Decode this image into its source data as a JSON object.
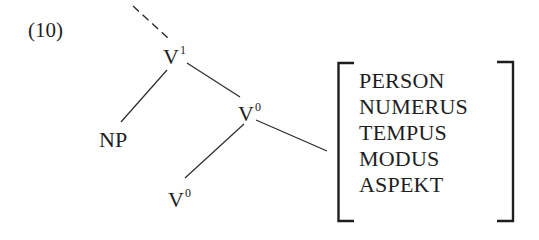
{
  "example": {
    "number": "(10)"
  },
  "tree": {
    "nodes": {
      "v1": {
        "base": "V",
        "sup": "1"
      },
      "np": {
        "label": "NP"
      },
      "v0_upper": {
        "base": "V",
        "sup": "0"
      },
      "v0_lower": {
        "base": "V",
        "sup": "0"
      }
    },
    "edges": [
      {
        "from": "above",
        "to": "v1",
        "style": "dashed"
      },
      {
        "from": "v1",
        "to": "np",
        "style": "solid"
      },
      {
        "from": "v1",
        "to": "v0_upper",
        "style": "solid"
      },
      {
        "from": "v0_upper",
        "to": "v0_lower",
        "style": "solid"
      },
      {
        "from": "v0_upper",
        "to": "feature-matrix",
        "style": "solid"
      }
    ]
  },
  "feature_matrix": {
    "features": [
      "PERSON",
      "NUMERUS",
      "TEMPUS",
      "MODUS",
      "ASPEKT"
    ]
  },
  "colors": {
    "ink": "#1e1e1e",
    "background": "#ffffff"
  }
}
